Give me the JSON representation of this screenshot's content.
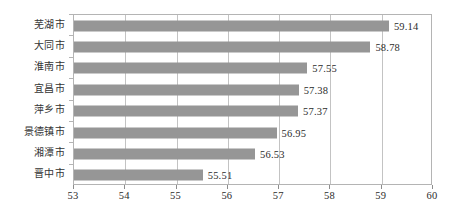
{
  "chart_data": {
    "type": "bar",
    "orientation": "horizontal",
    "title": "",
    "subtitle": "",
    "xlabel": "",
    "ylabel": "",
    "categories": [
      "芜湖市",
      "大同市",
      "淮南市",
      "宜昌市",
      "萍乡市",
      "景德镇市",
      "湘潭市",
      "晋中市"
    ],
    "values": [
      59.14,
      58.78,
      57.55,
      57.38,
      57.37,
      56.95,
      56.53,
      55.51
    ],
    "value_labels": [
      "59.14",
      "58.78",
      "57.55",
      "57.38",
      "57.37",
      "56.95",
      "56.53",
      "55.51"
    ],
    "xlim": [
      53,
      60
    ],
    "xticks": [
      53,
      54,
      55,
      56,
      57,
      58,
      59,
      60
    ],
    "xtick_labels": [
      "53",
      "54",
      "55",
      "56",
      "57",
      "58",
      "59",
      "60"
    ],
    "grid": "vertical",
    "legend": "none",
    "bar_color": "#969696",
    "grid_color": "#c3c3c3",
    "frame_color": "#b4b4b4",
    "text_color": "#2b2b2b"
  }
}
